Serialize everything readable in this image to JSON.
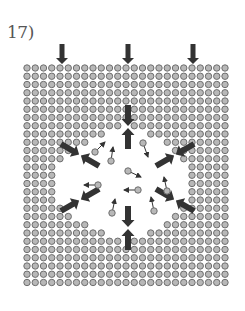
{
  "figure": {
    "label": "17)",
    "colors": {
      "particle_fill": "#b8b8b8",
      "particle_stroke": "#6e6e6e",
      "arrow": "#333333",
      "text": "#555555"
    },
    "grid": {
      "columns": 25,
      "rows": 27,
      "origin_x": 27,
      "origin_y": 68,
      "spacing": 8.25,
      "radius": 3.2
    },
    "void_rows": [
      {
        "row": 7,
        "gaps": [
          [
            12,
            12
          ]
        ]
      },
      {
        "row": 8,
        "gaps": [
          [
            10,
            14
          ]
        ]
      },
      {
        "row": 9,
        "gaps": [
          [
            8,
            16
          ]
        ]
      },
      {
        "row": 10,
        "gaps": [
          [
            6,
            17
          ]
        ]
      },
      {
        "row": 11,
        "gaps": [
          [
            5,
            18
          ]
        ]
      },
      {
        "row": 12,
        "gaps": [
          [
            4,
            19
          ]
        ]
      },
      {
        "row": 13,
        "gaps": [
          [
            4,
            19
          ]
        ]
      },
      {
        "row": 14,
        "gaps": [
          [
            4,
            19
          ]
        ]
      },
      {
        "row": 15,
        "gaps": [
          [
            4,
            19
          ]
        ]
      },
      {
        "row": 16,
        "gaps": [
          [
            4,
            19
          ]
        ]
      },
      {
        "row": 17,
        "gaps": [
          [
            5,
            18
          ]
        ]
      },
      {
        "row": 18,
        "gaps": [
          [
            6,
            17
          ]
        ]
      },
      {
        "row": 19,
        "gaps": [
          [
            8,
            16
          ]
        ]
      },
      {
        "row": 20,
        "gaps": [
          [
            10,
            14
          ]
        ]
      },
      {
        "row": 21,
        "gaps": [
          [
            12,
            12
          ]
        ]
      }
    ],
    "top_arrows": [
      {
        "x": 62,
        "y1": 44,
        "y2": 64
      },
      {
        "x": 128,
        "y1": 44,
        "y2": 64
      },
      {
        "x": 193,
        "y1": 44,
        "y2": 64
      }
    ],
    "stress_arrows": [
      {
        "name": "top-pair",
        "x": 128,
        "y": 127,
        "angle": 90
      },
      {
        "name": "bottom-pair",
        "x": 128,
        "y": 228,
        "angle": 90
      },
      {
        "name": "upper-left-pair",
        "x": 80,
        "y": 155,
        "angle": 30
      },
      {
        "name": "upper-right-pair",
        "x": 175,
        "y": 155,
        "angle": -30
      },
      {
        "name": "lower-left-pair",
        "x": 80,
        "y": 200,
        "angle": -30
      },
      {
        "name": "lower-right-pair",
        "x": 175,
        "y": 200,
        "angle": 30
      }
    ],
    "mobile_particles": [
      {
        "x": 95,
        "y": 152,
        "dx": 10,
        "dy": -10
      },
      {
        "x": 111,
        "y": 161,
        "dx": 2,
        "dy": -14
      },
      {
        "x": 143,
        "y": 143,
        "dx": 5,
        "dy": 14
      },
      {
        "x": 128,
        "y": 171,
        "dx": 13,
        "dy": 6
      },
      {
        "x": 98,
        "y": 185,
        "dx": -14,
        "dy": 0
      },
      {
        "x": 138,
        "y": 190,
        "dx": -14,
        "dy": 0
      },
      {
        "x": 167,
        "y": 191,
        "dx": -3,
        "dy": -14
      },
      {
        "x": 112,
        "y": 213,
        "dx": 3,
        "dy": -14
      },
      {
        "x": 154,
        "y": 211,
        "dx": -3,
        "dy": -14
      }
    ]
  }
}
